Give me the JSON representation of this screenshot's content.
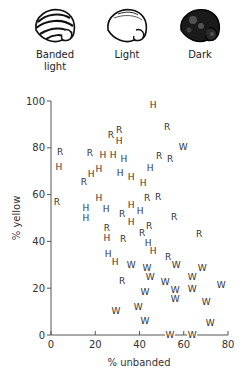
{
  "legend": [
    {
      "key": "banded",
      "label_line1": "Banded",
      "label_line2": "light",
      "icon": "banded-light-snail-shell-icon",
      "cx": 55
    },
    {
      "key": "light",
      "label_line1": "Light",
      "label_line2": "",
      "icon": "light-snail-shell-icon",
      "cx": 127
    },
    {
      "key": "dark",
      "label_line1": "Dark",
      "label_line2": "",
      "icon": "dark-snail-shell-icon",
      "cx": 200
    }
  ],
  "chart_data": {
    "type": "scatter",
    "title": "",
    "xlabel": "% unbanded",
    "ylabel": "% yellow",
    "xlim": [
      0,
      80
    ],
    "ylim": [
      0,
      100
    ],
    "xticks": [
      0,
      20,
      40,
      60,
      80
    ],
    "yticks": [
      0,
      20,
      40,
      60,
      80,
      100
    ],
    "grid": false,
    "marker_legend": "Points are plotted as letters: H, R, W",
    "points": [
      {
        "label": "H",
        "x": 46.2,
        "y": 98.3
      },
      {
        "label": "R",
        "x": 52.5,
        "y": 88.9
      },
      {
        "label": "R",
        "x": 27.1,
        "y": 85.5
      },
      {
        "label": "R",
        "x": 30.8,
        "y": 87.6
      },
      {
        "label": "H",
        "x": 30.8,
        "y": 82.9
      },
      {
        "label": "W",
        "x": 59.7,
        "y": 80.3
      },
      {
        "label": "R",
        "x": 4.1,
        "y": 78.2
      },
      {
        "label": "H",
        "x": 3.6,
        "y": 71.8
      },
      {
        "label": "R",
        "x": 17.6,
        "y": 77.8
      },
      {
        "label": "H",
        "x": 23.5,
        "y": 76.9
      },
      {
        "label": "H",
        "x": 28.1,
        "y": 76.9
      },
      {
        "label": "H",
        "x": 33.0,
        "y": 75.2
      },
      {
        "label": "R",
        "x": 48.9,
        "y": 76.5
      },
      {
        "label": "R",
        "x": 53.8,
        "y": 75.2
      },
      {
        "label": "H",
        "x": 44.8,
        "y": 71.4
      },
      {
        "label": "H",
        "x": 21.7,
        "y": 70.9
      },
      {
        "label": "H",
        "x": 18.1,
        "y": 68.8
      },
      {
        "label": "R",
        "x": 14.9,
        "y": 65.4
      },
      {
        "label": "H",
        "x": 31.2,
        "y": 69.2
      },
      {
        "label": "H",
        "x": 36.2,
        "y": 67.5
      },
      {
        "label": "H",
        "x": 41.6,
        "y": 65.0
      },
      {
        "label": "R",
        "x": 2.7,
        "y": 56.8
      },
      {
        "label": "H",
        "x": 21.7,
        "y": 58.5
      },
      {
        "label": "R",
        "x": 43.4,
        "y": 58.5
      },
      {
        "label": "R",
        "x": 48.4,
        "y": 59.0
      },
      {
        "label": "H",
        "x": 15.8,
        "y": 54.3
      },
      {
        "label": "H",
        "x": 15.8,
        "y": 50.0
      },
      {
        "label": "H",
        "x": 24.9,
        "y": 53.8
      },
      {
        "label": "R",
        "x": 32.1,
        "y": 51.7
      },
      {
        "label": "H",
        "x": 36.2,
        "y": 55.6
      },
      {
        "label": "H",
        "x": 40.3,
        "y": 53.0
      },
      {
        "label": "R",
        "x": 55.7,
        "y": 50.4
      },
      {
        "label": "H",
        "x": 36.2,
        "y": 48.3
      },
      {
        "label": "R",
        "x": 25.3,
        "y": 45.7
      },
      {
        "label": "H",
        "x": 25.3,
        "y": 41.5
      },
      {
        "label": "R",
        "x": 44.3,
        "y": 46.6
      },
      {
        "label": "R",
        "x": 41.2,
        "y": 43.6
      },
      {
        "label": "R",
        "x": 32.6,
        "y": 41.0
      },
      {
        "label": "R",
        "x": 67.0,
        "y": 43.2
      },
      {
        "label": "H",
        "x": 43.9,
        "y": 39.3
      },
      {
        "label": "H",
        "x": 46.2,
        "y": 35.9
      },
      {
        "label": "H",
        "x": 25.8,
        "y": 34.6
      },
      {
        "label": "H",
        "x": 29.0,
        "y": 31.2
      },
      {
        "label": "R",
        "x": 52.9,
        "y": 33.3
      },
      {
        "label": "W",
        "x": 36.2,
        "y": 29.9
      },
      {
        "label": "W",
        "x": 56.6,
        "y": 29.9
      },
      {
        "label": "W",
        "x": 43.4,
        "y": 28.6
      },
      {
        "label": "W",
        "x": 68.3,
        "y": 28.6
      },
      {
        "label": "W",
        "x": 44.8,
        "y": 24.8
      },
      {
        "label": "R",
        "x": 32.1,
        "y": 23.1
      },
      {
        "label": "W",
        "x": 51.6,
        "y": 22.6
      },
      {
        "label": "W",
        "x": 63.8,
        "y": 24.8
      },
      {
        "label": "W",
        "x": 76.9,
        "y": 21.4
      },
      {
        "label": "W",
        "x": 56.1,
        "y": 19.2
      },
      {
        "label": "W",
        "x": 63.8,
        "y": 19.7
      },
      {
        "label": "W",
        "x": 42.5,
        "y": 18.4
      },
      {
        "label": "W",
        "x": 56.1,
        "y": 15.4
      },
      {
        "label": "W",
        "x": 70.1,
        "y": 14.1
      },
      {
        "label": "W",
        "x": 39.4,
        "y": 12.0
      },
      {
        "label": "W",
        "x": 29.4,
        "y": 10.3
      },
      {
        "label": "W",
        "x": 42.5,
        "y": 6.0
      },
      {
        "label": "W",
        "x": 71.9,
        "y": 5.1
      },
      {
        "label": "W",
        "x": 53.8,
        "y": 0.0
      },
      {
        "label": "W",
        "x": 63.8,
        "y": 0.0
      }
    ]
  },
  "colors": {
    "ink": "#333333",
    "axis": "#555555",
    "background": "#ffffff"
  }
}
